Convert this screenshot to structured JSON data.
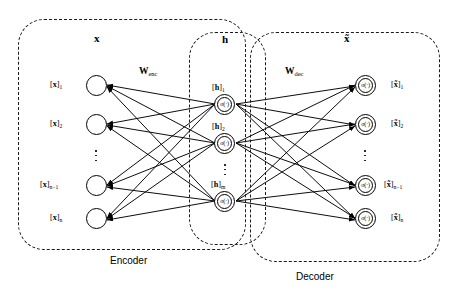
{
  "figure": {
    "type": "autoencoder-architecture-diagram",
    "groups": [
      {
        "id": "encoder-box",
        "label": "Encoder",
        "header": "x"
      },
      {
        "id": "hidden-box",
        "label": "",
        "header": "h"
      },
      {
        "id": "decoder-box",
        "label": "Decoder",
        "header": "x̃"
      }
    ],
    "section_labels": {
      "encoder": "Encoder",
      "decoder": "Decoder"
    },
    "headers": {
      "input": "x",
      "hidden": "h",
      "output": "x̃"
    },
    "weights": {
      "encoder": {
        "symbol": "W",
        "subscript": "enc"
      },
      "decoder": {
        "symbol": "W",
        "subscript": "dec"
      }
    },
    "layers": {
      "input": {
        "name": "input-layer",
        "activation": "",
        "nodes": [
          {
            "bracket_open": "[",
            "var": "x",
            "bracket_close": "]",
            "sub": "1"
          },
          {
            "bracket_open": "[",
            "var": "x",
            "bracket_close": "]",
            "sub": "2"
          },
          {
            "bracket_open": "[",
            "var": "x",
            "bracket_close": "]",
            "sub": "n−1"
          },
          {
            "bracket_open": "[",
            "var": "x",
            "bracket_close": "]",
            "sub": "n"
          }
        ]
      },
      "hidden": {
        "name": "hidden-layer",
        "activation": "σ(·)",
        "nodes": [
          {
            "bracket_open": "[",
            "var": "h",
            "bracket_close": "]",
            "sub": "1"
          },
          {
            "bracket_open": "[",
            "var": "h",
            "bracket_close": "]",
            "sub": "2"
          },
          {
            "bracket_open": "[",
            "var": "h",
            "bracket_close": "]",
            "sub": "m"
          }
        ]
      },
      "output": {
        "name": "output-layer",
        "activation": "σ(·)",
        "nodes": [
          {
            "bracket_open": "[",
            "var": "x̃",
            "bracket_close": "]",
            "sub": "1"
          },
          {
            "bracket_open": "[",
            "var": "x̃",
            "bracket_close": "]",
            "sub": "2"
          },
          {
            "bracket_open": "[",
            "var": "x̃",
            "bracket_close": "]",
            "sub": "n−1"
          },
          {
            "bracket_open": "[",
            "var": "x̃",
            "bracket_close": "]",
            "sub": "n"
          }
        ]
      }
    },
    "colors": {
      "stroke": "#000000",
      "background": "#ffffff",
      "dashed_border": "#1a1a1a"
    }
  }
}
